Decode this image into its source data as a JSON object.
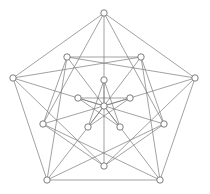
{
  "diagram": {
    "type": "graph",
    "colors": {
      "edge": "#7a7a7a",
      "node_fill": "#ffffff",
      "node_stroke": "#6e6e6e",
      "background": "#ffffff"
    },
    "node_radius": 3.2,
    "nodes": [
      {
        "id": "O0",
        "x": 104,
        "y": 13
      },
      {
        "id": "O1",
        "x": 195,
        "y": 78
      },
      {
        "id": "O2",
        "x": 160,
        "y": 180
      },
      {
        "id": "O3",
        "x": 47,
        "y": 180
      },
      {
        "id": "O4",
        "x": 13,
        "y": 78
      },
      {
        "id": "M0",
        "x": 67,
        "y": 57
      },
      {
        "id": "M1",
        "x": 141,
        "y": 57
      },
      {
        "id": "M2",
        "x": 164,
        "y": 124
      },
      {
        "id": "M3",
        "x": 104,
        "y": 166
      },
      {
        "id": "M4",
        "x": 43,
        "y": 124
      },
      {
        "id": "I0",
        "x": 104,
        "y": 80
      },
      {
        "id": "I1",
        "x": 130,
        "y": 98
      },
      {
        "id": "I2",
        "x": 120,
        "y": 127
      },
      {
        "id": "I3",
        "x": 88,
        "y": 127
      },
      {
        "id": "I4",
        "x": 78,
        "y": 98
      },
      {
        "id": "C",
        "x": 104,
        "y": 106
      }
    ],
    "edges": [
      [
        "O0",
        "O1"
      ],
      [
        "O1",
        "O2"
      ],
      [
        "O2",
        "O3"
      ],
      [
        "O3",
        "O4"
      ],
      [
        "O4",
        "O0"
      ],
      [
        "O0",
        "I0"
      ],
      [
        "O0",
        "M4"
      ],
      [
        "O0",
        "M2"
      ],
      [
        "O1",
        "I1"
      ],
      [
        "O1",
        "M0"
      ],
      [
        "O1",
        "M3"
      ],
      [
        "O2",
        "I2"
      ],
      [
        "O2",
        "M1"
      ],
      [
        "O2",
        "M4"
      ],
      [
        "O3",
        "I3"
      ],
      [
        "O3",
        "M2"
      ],
      [
        "O3",
        "M0"
      ],
      [
        "O4",
        "I4"
      ],
      [
        "O4",
        "M3"
      ],
      [
        "O4",
        "M1"
      ],
      [
        "M0",
        "M1"
      ],
      [
        "M1",
        "M2"
      ],
      [
        "M2",
        "M3"
      ],
      [
        "M3",
        "M4"
      ],
      [
        "M4",
        "M0"
      ],
      [
        "M0",
        "I2"
      ],
      [
        "M1",
        "I3"
      ],
      [
        "M2",
        "I4"
      ],
      [
        "M3",
        "I0"
      ],
      [
        "M4",
        "I1"
      ],
      [
        "I0",
        "I2"
      ],
      [
        "I2",
        "I4"
      ],
      [
        "I4",
        "I1"
      ],
      [
        "I1",
        "I3"
      ],
      [
        "I3",
        "I0"
      ],
      [
        "C",
        "I0"
      ],
      [
        "C",
        "I1"
      ],
      [
        "C",
        "I2"
      ],
      [
        "C",
        "I3"
      ],
      [
        "C",
        "I4"
      ]
    ]
  }
}
